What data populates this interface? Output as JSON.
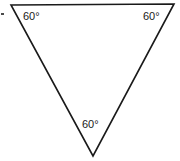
{
  "figure": {
    "background_color": "#ffffff",
    "stroke_color": "#1a1a1a",
    "text_color": "#1a1a1a",
    "shape": {
      "name": "triangle",
      "orientation": "inverted",
      "vertices": [
        {
          "name": "top-left",
          "x": 11,
          "y": 5
        },
        {
          "name": "top-right",
          "x": 174,
          "y": 4
        },
        {
          "name": "bottom",
          "x": 93,
          "y": 156
        }
      ]
    },
    "labels": {
      "top_left": "60°",
      "top_right": "60°",
      "bottom": "60°"
    },
    "marks": {
      "left_edge_dot": "dot-mark"
    }
  }
}
